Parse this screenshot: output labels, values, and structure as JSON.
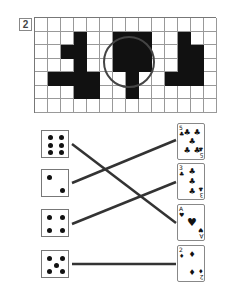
{
  "puzzle": {
    "number": "2",
    "grid": {
      "cols": 14,
      "rows": 7,
      "filled": [
        [
          1,
          3
        ],
        [
          1,
          6
        ],
        [
          1,
          7
        ],
        [
          1,
          8
        ],
        [
          1,
          11
        ],
        [
          2,
          2
        ],
        [
          2,
          3
        ],
        [
          2,
          6
        ],
        [
          2,
          7
        ],
        [
          2,
          8
        ],
        [
          2,
          11
        ],
        [
          2,
          12
        ],
        [
          3,
          3
        ],
        [
          3,
          6
        ],
        [
          3,
          7
        ],
        [
          3,
          8
        ],
        [
          3,
          11
        ],
        [
          3,
          12
        ],
        [
          4,
          1
        ],
        [
          4,
          2
        ],
        [
          4,
          3
        ],
        [
          4,
          4
        ],
        [
          4,
          7
        ],
        [
          4,
          10
        ],
        [
          4,
          11
        ],
        [
          4,
          12
        ],
        [
          5,
          3
        ],
        [
          5,
          4
        ],
        [
          5,
          7
        ]
      ],
      "circle": {
        "cx": 95,
        "cy": 45,
        "r": 25,
        "color": "#444444"
      }
    }
  },
  "matching": {
    "dice": [
      {
        "value": 6,
        "top": 130
      },
      {
        "value": 2,
        "top": 169
      },
      {
        "value": 4,
        "top": 209
      },
      {
        "value": 5,
        "top": 250
      }
    ],
    "cards": [
      {
        "rank": "5",
        "suit": "♣",
        "suit_name": "clubs",
        "top": 123
      },
      {
        "rank": "3",
        "suit": "♣",
        "suit_name": "clubs",
        "top": 163
      },
      {
        "rank": "A",
        "suit": "♥",
        "suit_name": "hearts",
        "top": 204
      },
      {
        "rank": "2",
        "suit": "♦",
        "suit_name": "diamonds",
        "top": 245
      }
    ],
    "connections": [
      {
        "from_die": 0,
        "to_card": 2,
        "x1": 72,
        "y1": 144,
        "x2": 176,
        "y2": 223
      },
      {
        "from_die": 1,
        "to_card": 0,
        "x1": 72,
        "y1": 183,
        "x2": 176,
        "y2": 140
      },
      {
        "from_die": 2,
        "to_card": 1,
        "x1": 72,
        "y1": 224,
        "x2": 176,
        "y2": 182
      },
      {
        "from_die": 3,
        "to_card": 3,
        "x1": 72,
        "y1": 264,
        "x2": 176,
        "y2": 264
      }
    ],
    "line_color": "#333333"
  }
}
